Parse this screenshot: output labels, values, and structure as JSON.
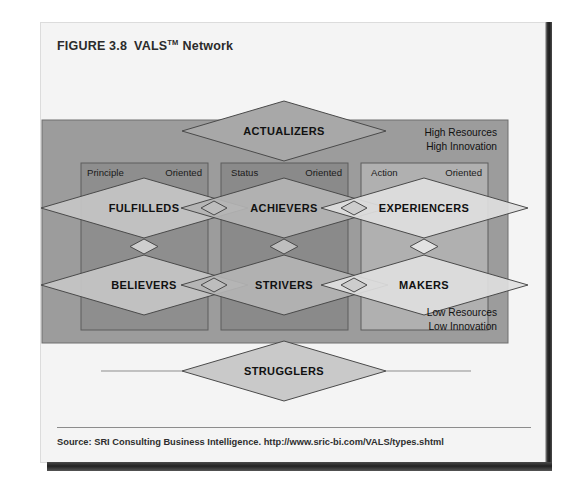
{
  "figure": {
    "number_label": "FIGURE 3.8",
    "title_main": "VALS",
    "title_tm": "TM",
    "title_suffix": "Network",
    "source": "Source: SRI Consulting Business Intelligence. http://www.sric-bi.com/VALS/types.shtml"
  },
  "colors": {
    "page_background": "#ffffff",
    "card_background": "#f4f4f4",
    "outer_panel": "#9c9c9c",
    "column_left_panel": "#8e8e8e",
    "column_center_panel": "#8a8a8a",
    "column_right_panel": "#b0b0b0",
    "diamond_left": "#c6c6c6",
    "diamond_center": "#b4b4b4",
    "diamond_right": "#dedede",
    "diamond_top": "#a8a8a8",
    "diamond_bottom": "#c9c9c9",
    "stroke": "#4a4a4a",
    "text": "#111111"
  },
  "diagram": {
    "top_node": {
      "label": "ACTUALIZERS"
    },
    "bottom_node": {
      "label": "STRUGGLERS"
    },
    "corner_notes": {
      "top_right_line1": "High Resources",
      "top_right_line2": "High Innovation",
      "bottom_right_line1": "Low Resources",
      "bottom_right_line2": "Low Innovation"
    },
    "columns": [
      {
        "id": "principle",
        "header_left": "Principle",
        "header_right": "Oriented",
        "upper_node": "FULFILLEDS",
        "lower_node": "BELIEVERS"
      },
      {
        "id": "status",
        "header_left": "Status",
        "header_right": "Oriented",
        "upper_node": "ACHIEVERS",
        "lower_node": "STRIVERS"
      },
      {
        "id": "action",
        "header_left": "Action",
        "header_right": "Oriented",
        "upper_node": "EXPERIENCERS",
        "lower_node": "MAKERS"
      }
    ]
  }
}
